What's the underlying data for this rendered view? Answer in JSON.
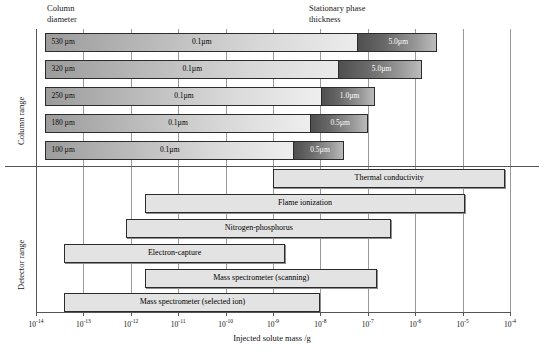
{
  "headers": {
    "column_diameter": "Column\ndiameter",
    "stationary_phase": "Stationary phase\nthickness"
  },
  "axes": {
    "x_title": "Injected solute mass /g",
    "y_group_top": "Column range",
    "y_group_bottom": "Detector range",
    "x_ticks": [
      "-14",
      "-13",
      "-12",
      "-11",
      "-10",
      "-9",
      "-8",
      "-7",
      "-6",
      "-5",
      "-4"
    ],
    "x_tick_base": "10",
    "x_min_exp": -14,
    "x_max_exp": -4
  },
  "caption": "",
  "chart_data": {
    "type": "bar",
    "xlabel": "Injected solute mass /g",
    "ylabel": "",
    "xscale": "log10",
    "xlim": [
      -14,
      -4
    ],
    "grid": true,
    "legend": "none",
    "groups": [
      {
        "name": "Column range",
        "header_left": "Column diameter",
        "header_right": "Stationary phase thickness",
        "bars": [
          {
            "label": "530 µm",
            "x_start": -13.8,
            "x_end": -5.55,
            "segments": [
              {
                "label": "0.1µm",
                "x_start": -13.8,
                "x_end": -7.25,
                "shade": "light"
              },
              {
                "label": "5.0µm",
                "x_start": -7.25,
                "x_end": -5.55,
                "shade": "dark"
              }
            ]
          },
          {
            "label": "320 µm",
            "x_start": -13.8,
            "x_end": -5.85,
            "segments": [
              {
                "label": "0.1µm",
                "x_start": -13.8,
                "x_end": -7.65,
                "shade": "light"
              },
              {
                "label": "5.0µm",
                "x_start": -7.65,
                "x_end": -5.85,
                "shade": "dark"
              }
            ]
          },
          {
            "label": "250 µm",
            "x_start": -13.8,
            "x_end": -6.85,
            "segments": [
              {
                "label": "0.1µm",
                "x_start": -13.8,
                "x_end": -8.0,
                "shade": "light"
              },
              {
                "label": "1.0µm",
                "x_start": -8.0,
                "x_end": -6.85,
                "shade": "dark"
              }
            ]
          },
          {
            "label": "180 µm",
            "x_start": -13.8,
            "x_end": -7.0,
            "segments": [
              {
                "label": "0.1µm",
                "x_start": -13.8,
                "x_end": -8.25,
                "shade": "light"
              },
              {
                "label": "0.5µm",
                "x_start": -8.25,
                "x_end": -7.0,
                "shade": "dark"
              }
            ]
          },
          {
            "label": "100 µm",
            "x_start": -13.8,
            "x_end": -7.5,
            "segments": [
              {
                "label": "0.1µm",
                "x_start": -13.8,
                "x_end": -8.6,
                "shade": "light"
              },
              {
                "label": "0.5µm",
                "x_start": -8.6,
                "x_end": -7.5,
                "shade": "dark"
              }
            ]
          }
        ]
      },
      {
        "name": "Detector range",
        "bars": [
          {
            "label": "Thermal conductivity",
            "x_start": -9.0,
            "x_end": -4.1
          },
          {
            "label": "Flame ionization",
            "x_start": -11.7,
            "x_end": -4.95
          },
          {
            "label": "Nitrogen-phosphorus",
            "x_start": -12.1,
            "x_end": -6.5
          },
          {
            "label": "Electron-capture",
            "x_start": -13.4,
            "x_end": -8.75
          },
          {
            "label": "Mass spectrometer (scanning)",
            "x_start": -11.7,
            "x_end": -6.8
          },
          {
            "label": "Mass spectrometer (selected ion)",
            "x_start": -13.4,
            "x_end": -8.0
          }
        ]
      }
    ]
  }
}
